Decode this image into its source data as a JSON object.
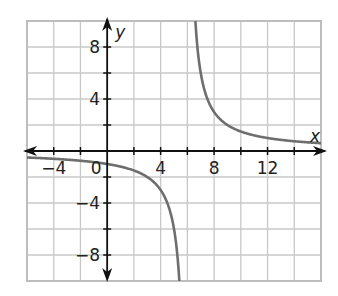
{
  "chart_data": {
    "type": "line",
    "title": "",
    "xlabel": "x",
    "ylabel": "y",
    "xlim": [
      -6,
      16
    ],
    "ylim": [
      -10,
      10
    ],
    "grid": true,
    "grid_step": 2,
    "x_tick_labels": [
      {
        "value": -4,
        "label": "−4"
      },
      {
        "value": 0,
        "label": "0"
      },
      {
        "value": 4,
        "label": "4"
      },
      {
        "value": 8,
        "label": "8"
      },
      {
        "value": 12,
        "label": "12"
      }
    ],
    "y_tick_labels": [
      {
        "value": 8,
        "label": "8"
      },
      {
        "value": 4,
        "label": "4"
      },
      {
        "value": -4,
        "label": "−4"
      },
      {
        "value": -8,
        "label": "−8"
      }
    ],
    "series": [
      {
        "name": "y = 6/(x − 6)",
        "vertical_asymptote": 6,
        "horizontal_asymptote": 0,
        "points": [
          [
            -6,
            -0.5
          ],
          [
            -4,
            -0.6
          ],
          [
            -2,
            -0.75
          ],
          [
            0,
            -1
          ],
          [
            2,
            -1.5
          ],
          [
            3,
            -2
          ],
          [
            4,
            -3
          ],
          [
            5,
            -6
          ],
          [
            5.4,
            -10
          ],
          [
            6.6,
            10
          ],
          [
            7,
            6
          ],
          [
            8,
            3
          ],
          [
            9,
            2
          ],
          [
            10,
            1.5
          ],
          [
            12,
            1
          ],
          [
            14,
            0.75
          ],
          [
            16,
            0.6
          ]
        ],
        "color": "#6e6e6e"
      }
    ],
    "legend": null
  },
  "colors": {
    "grid": "#c8c8c8",
    "axis": "#111111",
    "curve": "#6e6e6e",
    "frame": "#bdbdbd"
  }
}
